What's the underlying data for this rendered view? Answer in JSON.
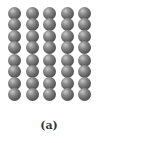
{
  "figure": {
    "caption": "(a)",
    "layout": {
      "rows": 4,
      "columns": 5
    },
    "molecule_type": "diatomic",
    "atom_color": "#6a6a6a",
    "column_centers_x": [
      14,
      32,
      49,
      67,
      84
    ],
    "row_top_y": [
      7,
      30,
      54,
      77
    ]
  }
}
